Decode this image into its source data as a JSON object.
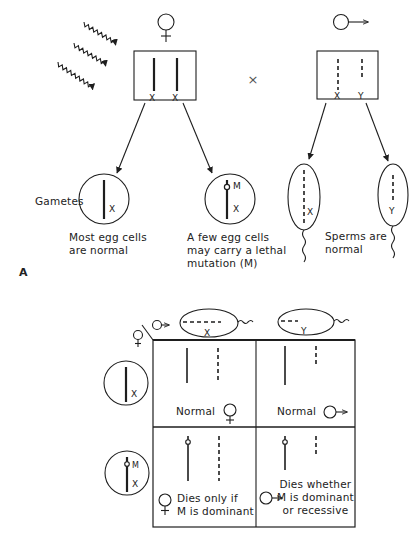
{
  "figure": {
    "part_label": "A",
    "colors": {
      "ink": "#1e1e1e",
      "background": "#ffffff"
    }
  },
  "parents": {
    "female": {
      "symbol": "female-symbol",
      "chromosomes": [
        "X",
        "X"
      ]
    },
    "cross_symbol": "×",
    "male": {
      "symbol": "male-symbol",
      "chromosomes": [
        "X",
        "Y"
      ]
    },
    "radiation": "wavy-arrows"
  },
  "gametes": {
    "label": "Gametes",
    "egg_normal": {
      "chromosome": "X",
      "caption_lines": [
        "Most egg cells",
        "are normal"
      ]
    },
    "egg_mutant": {
      "chromosome": "X",
      "mutation": "M",
      "caption_lines": [
        "A few egg cells",
        "may carry a lethal",
        "mutation (M)"
      ]
    },
    "sperm_x": {
      "chromosome": "X"
    },
    "sperm_y": {
      "chromosome": "Y"
    },
    "sperm_caption_lines": [
      "Sperms are",
      "normal"
    ]
  },
  "punnett": {
    "column_headers": [
      {
        "sperm": "X"
      },
      {
        "sperm": "Y"
      }
    ],
    "row_headers": [
      {
        "egg": "X"
      },
      {
        "egg": "X",
        "mutation": "M"
      }
    ],
    "cells": [
      {
        "row": 0,
        "col": 0,
        "text": "Normal",
        "sex": "female"
      },
      {
        "row": 0,
        "col": 1,
        "text": "Normal",
        "sex": "male"
      },
      {
        "row": 1,
        "col": 0,
        "lines": [
          "Dies only if",
          "M is dominant"
        ],
        "sex": "female"
      },
      {
        "row": 1,
        "col": 1,
        "lines": [
          "Dies whether",
          "M is dominant",
          "or recessive"
        ],
        "sex": "male"
      }
    ]
  }
}
